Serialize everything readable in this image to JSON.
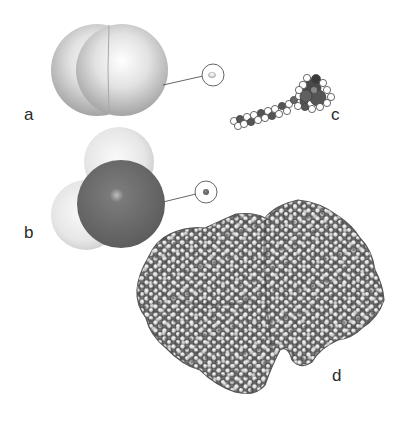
{
  "figure": {
    "panels": [
      {
        "id": "a",
        "label": "a",
        "subject": "hydrogen-molecule",
        "inset": "magnified-scale-circle"
      },
      {
        "id": "b",
        "label": "b",
        "subject": "water-molecule",
        "inset": "magnified-scale-circle"
      },
      {
        "id": "c",
        "label": "c",
        "subject": "lipid-like-molecule"
      },
      {
        "id": "d",
        "label": "d",
        "subject": "protein"
      }
    ],
    "colors": {
      "background": "#ffffff",
      "hydrogen": "#e8e8e8",
      "oxygen": "#666666",
      "carbon_dark": "#555555",
      "atom_light": "#dcdcdc",
      "label": "#2a2a2a",
      "callout_line": "#555555"
    }
  }
}
